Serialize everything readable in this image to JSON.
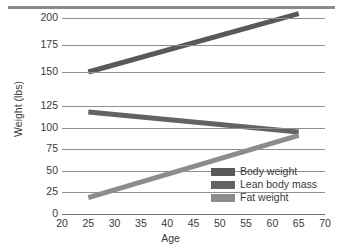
{
  "chart_data": {
    "type": "line",
    "title": "",
    "xlabel": "Age",
    "ylabel": "Weight (lbs)",
    "xlim": [
      20,
      70
    ],
    "ylim": [
      0,
      200
    ],
    "xticks": [
      20,
      25,
      30,
      35,
      40,
      45,
      50,
      55,
      60,
      65,
      70
    ],
    "yticks": [
      0,
      25,
      50,
      75,
      100,
      125,
      150,
      175,
      200
    ],
    "axis_break": {
      "present": true,
      "between": [
        125,
        150
      ],
      "note": "y-axis is broken between 125 and 150"
    },
    "grid": true,
    "grid_axis": "y",
    "legend_position": "lower right",
    "x": [
      25,
      65
    ],
    "series": [
      {
        "name": "Body weight",
        "color": "#595959",
        "values": [
          150,
          204
        ]
      },
      {
        "name": "Lean body mass",
        "color": "#636363",
        "values": [
          118,
          95
        ]
      },
      {
        "name": "Fat weight",
        "color": "#8c8c8c",
        "values": [
          19,
          91
        ]
      }
    ]
  },
  "axes": {
    "y_label": "Weight (lbs)",
    "x_label": "Age",
    "y_tick_labels": [
      "0",
      "25",
      "50",
      "75",
      "100",
      "125",
      "150",
      "175",
      "200"
    ],
    "x_tick_labels": [
      "20",
      "25",
      "30",
      "35",
      "40",
      "45",
      "50",
      "55",
      "60",
      "65",
      "70"
    ]
  },
  "legend": {
    "items": [
      {
        "label": "Body weight",
        "color": "#595959"
      },
      {
        "label": "Lean body mass",
        "color": "#636363"
      },
      {
        "label": "Fat weight",
        "color": "#8c8c8c"
      }
    ]
  },
  "colors": {
    "grid": "#8f8f8f",
    "axis": "#6d6d6d",
    "text": "#3a3a3a",
    "top_rule": "#8a8a8a",
    "background": "#ffffff"
  }
}
